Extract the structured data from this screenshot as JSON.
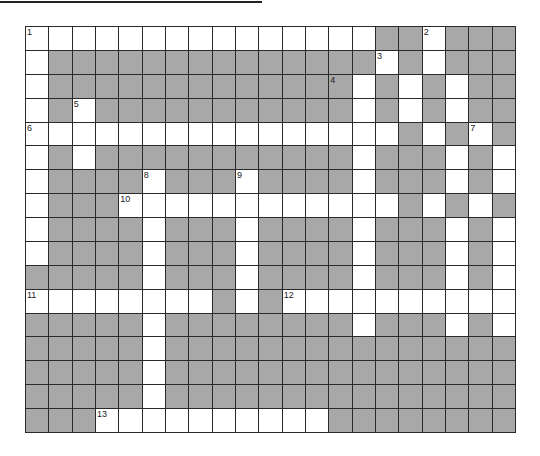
{
  "puzzle": {
    "rows": 17,
    "cols": 21,
    "block_color": "#a8a8a8",
    "line_color": "#2a2a2a",
    "layout": [
      "111111111111111001000",
      "100000000000000101000",
      "100000000000001010100",
      "101000000000001010100",
      "111111111111111101010",
      "101000000000001000101",
      "100001000100001000101",
      "100011111111111101010",
      "100001000100001000101",
      "100001000100001000101",
      "000001000100001000101",
      "111111110101111111111",
      "000001000000001000101",
      "000001000000000000000",
      "000001000000000000000",
      "000001000000000000000",
      "000111111111100000000"
    ],
    "numbers": [
      {
        "row": 0,
        "col": 0,
        "label": "1"
      },
      {
        "row": 0,
        "col": 17,
        "label": "2"
      },
      {
        "row": 1,
        "col": 15,
        "label": "3"
      },
      {
        "row": 2,
        "col": 13,
        "label": "4"
      },
      {
        "row": 3,
        "col": 2,
        "label": "5"
      },
      {
        "row": 4,
        "col": 0,
        "label": "6"
      },
      {
        "row": 4,
        "col": 19,
        "label": "7"
      },
      {
        "row": 6,
        "col": 5,
        "label": "8"
      },
      {
        "row": 6,
        "col": 9,
        "label": "9"
      },
      {
        "row": 7,
        "col": 4,
        "label": "10"
      },
      {
        "row": 11,
        "col": 0,
        "label": "11"
      },
      {
        "row": 11,
        "col": 11,
        "label": "12"
      },
      {
        "row": 16,
        "col": 3,
        "label": "13"
      }
    ]
  }
}
